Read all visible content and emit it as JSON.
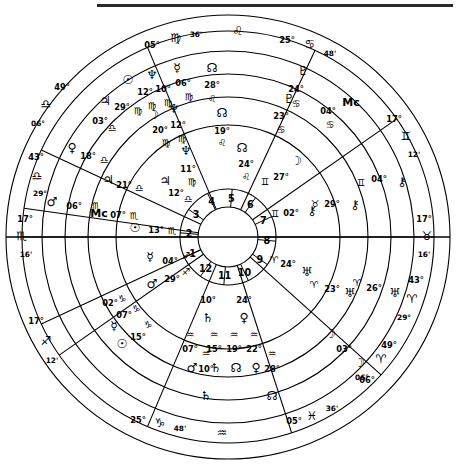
{
  "chart_data": {
    "type": "astrology-wheel",
    "center": {
      "cx": 228,
      "cy": 237
    },
    "rings": [
      112,
      140,
      163,
      186,
      206,
      222
    ],
    "hub_radius": 30,
    "house_numbers": [
      "1",
      "2",
      "3",
      "4",
      "5",
      "6",
      "7",
      "8",
      "9",
      "10",
      "11",
      "12"
    ],
    "glyphs": {
      "aries": "♈",
      "taurus": "♉",
      "gemini": "♊",
      "cancer": "♋",
      "leo": "♌",
      "virgo": "♍",
      "libra": "♎",
      "scorpio": "♏",
      "sagittarius": "♐",
      "capricorn": "♑",
      "aquarius": "♒",
      "pisces": "♓",
      "sun": "☉",
      "moon": "☽",
      "mercury": "☿",
      "venus": "♀",
      "mars": "♂",
      "jupiter": "♃",
      "saturn": "♄",
      "uranus": "♅",
      "neptune": "♆",
      "pluto": "♇",
      "node": "☊",
      "chiron": "⚷",
      "asc": "As",
      "mc": "Mc"
    },
    "house_cusps": [
      {
        "house": "1",
        "deg": "02°",
        "sign": "capricorn",
        "min": "48'",
        "outer_deg": "25°",
        "outer_sign": "capricorn",
        "outer_min": "48'",
        "angle": 205
      },
      {
        "house": "2",
        "deg": "05°",
        "sign": "pisces",
        "min": "36'",
        "outer_deg": "05°",
        "outer_sign": "pisces",
        "outer_min": "36'",
        "angle": 247
      },
      {
        "house": "3",
        "deg": "06°",
        "sign": "aries",
        "min": "49'",
        "outer_deg": "06°",
        "outer_sign": "aries",
        "outer_min": "49'",
        "angle": 288
      },
      {
        "house": "4",
        "deg": "29°",
        "sign": "aries",
        "min": "43'",
        "outer_deg": "29°",
        "outer_sign": "aries",
        "outer_min": "43'",
        "angle": 318
      },
      {
        "house": "5",
        "deg": "17°",
        "sign": "taurus",
        "min": "16'",
        "outer_deg": "17°",
        "outer_sign": "taurus",
        "outer_min": "16'",
        "angle": 0
      },
      {
        "house": "6",
        "deg": "12°",
        "sign": "gemini",
        "min": "12'",
        "outer_deg": "17°",
        "outer_sign": "gemini",
        "outer_min": "12'",
        "angle": 35
      },
      {
        "house": "7",
        "deg": "25°",
        "sign": "cancer",
        "min": "48'",
        "outer_deg": "25°",
        "outer_sign": "cancer",
        "outer_min": "48'",
        "angle": 65
      },
      {
        "house": "8",
        "deg": "05°",
        "sign": "virgo",
        "min": "36'",
        "outer_deg": "05°",
        "outer_sign": "virgo",
        "outer_min": "36'",
        "angle": 113
      },
      {
        "house": "9",
        "deg": "06°",
        "sign": "libra",
        "min": "49'",
        "outer_deg": "06°",
        "outer_sign": "libra",
        "outer_min": "49'",
        "angle": 155
      },
      {
        "house": "10",
        "deg": "29°",
        "sign": "libra",
        "min": "43'",
        "outer_deg": "29°",
        "outer_sign": "libra",
        "outer_min": "43'",
        "angle": 172
      },
      {
        "house": "11",
        "deg": "17°",
        "sign": "scorpio",
        "min": "16'",
        "outer_deg": "17°",
        "outer_sign": "scorpio",
        "outer_min": "16'",
        "angle": 180
      },
      {
        "house": "12",
        "deg": "17°",
        "sign": "sagittarius",
        "min": "12'",
        "outer_deg": "17°",
        "outer_sign": "sagittarius",
        "outer_min": "12'",
        "angle": 215
      }
    ],
    "outer_labels": [
      {
        "deg": "05°",
        "sign": "virgo",
        "min": "36'",
        "x": 152,
        "y": 48,
        "sx": 176,
        "sy": 42,
        "mx": 196,
        "my": 37
      },
      {
        "deg": "",
        "sign": "leo",
        "min": "",
        "x": 0,
        "y": 0,
        "sx": 238,
        "sy": 35,
        "mx": 0,
        "my": 0
      },
      {
        "deg": "25°",
        "sign": "cancer",
        "min": "48'",
        "x": 287,
        "y": 43,
        "sx": 310,
        "sy": 48,
        "mx": 330,
        "my": 56
      },
      {
        "deg": "17°",
        "sign": "gemini",
        "min": "12'",
        "x": 394,
        "y": 122,
        "sx": 406,
        "sy": 140,
        "mx": 414,
        "my": 157
      },
      {
        "deg": "17°",
        "sign": "taurus",
        "min": "16'",
        "x": 424,
        "y": 222,
        "sx": 427,
        "sy": 240,
        "mx": 424,
        "my": 257
      },
      {
        "deg": "43°",
        "sign": "aries",
        "min": "29°",
        "x": 416,
        "y": 283,
        "sx": 412,
        "sy": 303,
        "mx": 404,
        "my": 320
      },
      {
        "deg": "49°",
        "sign": "aries",
        "min": "06°",
        "x": 389,
        "y": 348,
        "sx": 381,
        "sy": 363,
        "mx": 362,
        "my": 380
      },
      {
        "deg": "05°",
        "sign": "pisces",
        "min": "36'",
        "x": 294,
        "y": 424,
        "sx": 312,
        "sy": 420,
        "mx": 332,
        "my": 411
      },
      {
        "deg": "",
        "sign": "aquarius",
        "min": "",
        "x": 0,
        "y": 0,
        "sx": 222,
        "sy": 437,
        "mx": 0,
        "my": 0
      },
      {
        "deg": "25°",
        "sign": "capricorn",
        "min": "48'",
        "x": 138,
        "y": 423,
        "sx": 160,
        "sy": 427,
        "mx": 180,
        "my": 431
      },
      {
        "deg": "17°",
        "sign": "sagittarius",
        "min": "12'",
        "x": 36,
        "y": 324,
        "sx": 46,
        "sy": 345,
        "mx": 52,
        "my": 363
      },
      {
        "deg": "17°",
        "sign": "scorpio",
        "min": "16'",
        "x": 25,
        "y": 222,
        "sx": 22,
        "sy": 240,
        "mx": 26,
        "my": 257
      },
      {
        "deg": "43°",
        "sign": "libra",
        "min": "29°",
        "x": 36,
        "y": 160,
        "sx": 37,
        "sy": 180,
        "mx": 40,
        "my": 196
      },
      {
        "deg": "49°",
        "sign": "libra",
        "min": "06°",
        "x": 62,
        "y": 90,
        "sx": 46,
        "sy": 108,
        "mx": 38,
        "my": 126
      }
    ],
    "planets_outer_ring": [
      {
        "name": "pluto",
        "deg": "24°",
        "sign": "cancer",
        "gx": 303,
        "gy": 75,
        "dx": 296,
        "dy": 92,
        "sx": 296,
        "sy": 107
      },
      {
        "name": "mc",
        "deg": "04°",
        "sign": "cancer",
        "gx": 351,
        "gy": 106,
        "dx": 328,
        "dy": 114,
        "sx": 330,
        "sy": 128,
        "islabel": true
      },
      {
        "name": "chiron",
        "deg": "04°",
        "sign": "gemini",
        "gx": 402,
        "gy": 186,
        "dx": 379,
        "dy": 182,
        "sx": 361,
        "sy": 186
      },
      {
        "name": "uranus",
        "deg": "26°",
        "sign": "aries",
        "gx": 395,
        "gy": 297,
        "dx": 374,
        "dy": 291,
        "sx": 357,
        "sy": 286
      },
      {
        "name": "moon",
        "deg": "06°",
        "sign": "aries",
        "gx": 359,
        "gy": 367,
        "dx": 367,
        "dy": 383,
        "sx": 0,
        "sy": 0
      },
      {
        "name": "node",
        "deg": "28°",
        "sign": "aquarius",
        "gx": 272,
        "gy": 400,
        "dx": 272,
        "dy": 372,
        "sx": 272,
        "sy": 357
      },
      {
        "name": "saturn",
        "deg": "10°",
        "sign": "aquarius",
        "gx": 206,
        "gy": 400,
        "dx": 206,
        "dy": 372,
        "sx": 206,
        "sy": 357
      },
      {
        "name": "mars",
        "deg": "06°",
        "sign": "scorpio",
        "gx": 52,
        "gy": 206,
        "dx": 74,
        "dy": 209,
        "sx": 96,
        "sy": 209
      },
      {
        "name": "venus",
        "deg": "18°",
        "sign": "libra",
        "gx": 72,
        "gy": 152,
        "dx": 88,
        "dy": 159,
        "sx": 104,
        "sy": 163
      },
      {
        "name": "jupiter",
        "deg": "29°",
        "sign": "virgo",
        "gx": 105,
        "gy": 105,
        "dx": 122,
        "dy": 110,
        "sx": 138,
        "sy": 114
      },
      {
        "name": "sun",
        "deg": "12°",
        "sign": "virgo",
        "gx": 128,
        "gy": 84,
        "dx": 145,
        "dy": 95,
        "sx": 152,
        "sy": 109
      },
      {
        "name": "neptune",
        "deg": "10°",
        "sign": "virgo",
        "gx": 152,
        "gy": 79,
        "dx": 163,
        "dy": 92,
        "sx": 168,
        "sy": 106
      },
      {
        "name": "mercury",
        "deg": "06°",
        "sign": "virgo",
        "gx": 177,
        "gy": 72,
        "dx": 183,
        "dy": 86,
        "sx": 189,
        "sy": 100
      }
    ],
    "planets_mid_ring": [
      {
        "name": "node",
        "deg": "28°",
        "sign": "leo",
        "gx": 212,
        "gy": 72,
        "dx": 212,
        "dy": 88,
        "sx": 212,
        "sy": 102
      },
      {
        "name": "pluto",
        "deg": "23°",
        "sign": "cancer",
        "gx": 289,
        "gy": 103,
        "dx": 281,
        "dy": 119,
        "sx": 281,
        "sy": 133
      },
      {
        "name": "moon",
        "deg": "27°",
        "sign": "gemini",
        "gx": 296,
        "gy": 165,
        "dx": 281,
        "dy": 180,
        "sx": 265,
        "sy": 185
      },
      {
        "name": "chiron",
        "deg": "29°",
        "sign": "taurus",
        "gx": 355,
        "gy": 209,
        "dx": 332,
        "dy": 207,
        "sx": 315,
        "sy": 207
      },
      {
        "name": "uranus",
        "deg": "23°",
        "sign": "aries",
        "gx": 350,
        "gy": 297,
        "dx": 332,
        "dy": 292,
        "sx": 314,
        "sy": 288
      },
      {
        "name": "moon2",
        "deg": "03°",
        "sign": "aries",
        "gx": 330,
        "gy": 338,
        "dx": 344,
        "dy": 352,
        "sx": 0,
        "sy": 0
      },
      {
        "name": "venus",
        "deg": "22°",
        "sign": "aquarius",
        "gx": 256,
        "gy": 372,
        "dx": 254,
        "dy": 352,
        "sx": 254,
        "sy": 338
      },
      {
        "name": "node2",
        "deg": "19°",
        "sign": "aquarius",
        "gx": 236,
        "gy": 372,
        "dx": 234,
        "dy": 352,
        "sx": 234,
        "sy": 338
      },
      {
        "name": "saturn2",
        "deg": "15°",
        "sign": "aquarius",
        "gx": 216,
        "gy": 372,
        "dx": 214,
        "dy": 352,
        "sx": 214,
        "sy": 338
      },
      {
        "name": "mars2",
        "deg": "07°",
        "sign": "aquarius",
        "gx": 192,
        "gy": 372,
        "dx": 190,
        "dy": 352,
        "sx": 190,
        "sy": 338
      },
      {
        "name": "sun2",
        "deg": "15°",
        "sign": "capricorn",
        "gx": 122,
        "gy": 348,
        "dx": 138,
        "dy": 340,
        "sx": 148,
        "sy": 328
      },
      {
        "name": "mercury2",
        "deg": "07°",
        "sign": "capricorn",
        "gx": 114,
        "gy": 330,
        "dx": 124,
        "dy": 318,
        "sx": 136,
        "sy": 312
      },
      {
        "name": "as",
        "deg": "02°",
        "sign": "capricorn",
        "gx": 95,
        "gy": 322,
        "dx": 110,
        "dy": 306,
        "sx": 122,
        "sy": 302,
        "islabel": true
      },
      {
        "name": "mc2",
        "deg": "07°",
        "sign": "scorpio",
        "gx": 99,
        "gy": 217,
        "dx": 118,
        "dy": 218,
        "sx": 134,
        "sy": 219,
        "islabel": true
      },
      {
        "name": "jupiter2",
        "deg": "21°",
        "sign": "libra",
        "gx": 108,
        "gy": 184,
        "dx": 124,
        "dy": 188,
        "sx": 139,
        "sy": 191
      },
      {
        "name": "as2",
        "deg": "03°",
        "sign": "libra",
        "gx": 88,
        "gy": 114,
        "dx": 100,
        "dy": 124,
        "sx": 112,
        "sy": 131,
        "islabel": true
      },
      {
        "name": "moon3",
        "deg": "20°",
        "sign": "virgo",
        "gx": 153,
        "gy": 119,
        "dx": 160,
        "dy": 133,
        "sx": 166,
        "sy": 146
      },
      {
        "name": "neptune2",
        "deg": "12°",
        "sign": "virgo",
        "gx": 174,
        "gy": 113,
        "dx": 178,
        "dy": 128,
        "sx": 182,
        "sy": 142
      }
    ],
    "planets_inner_ring": [
      {
        "name": "node",
        "deg": "19°",
        "sign": "leo",
        "gx": 222,
        "gy": 117,
        "dx": 222,
        "dy": 134,
        "sx": 222,
        "sy": 146
      },
      {
        "name": "neptune",
        "deg": "11°",
        "sign": "virgo",
        "gx": 186,
        "gy": 155,
        "dx": 188,
        "dy": 172,
        "sx": 192,
        "sy": 185
      },
      {
        "name": "node3",
        "deg": "24°",
        "sign": "leo",
        "gx": 242,
        "gy": 152,
        "dx": 246,
        "dy": 167,
        "sx": 246,
        "sy": 180
      },
      {
        "name": "chiron3",
        "deg": "02°",
        "sign": "gemini",
        "gx": 312,
        "gy": 215,
        "dx": 291,
        "dy": 216,
        "sx": 275,
        "sy": 217
      },
      {
        "name": "uranus3",
        "deg": "24°",
        "sign": "aries",
        "gx": 307,
        "gy": 276,
        "dx": 288,
        "dy": 267,
        "sx": 274,
        "sy": 263
      },
      {
        "name": "mercury3",
        "deg": "04°",
        "sign": "sagittarius",
        "gx": 150,
        "gy": 261,
        "dx": 170,
        "dy": 264,
        "sx": 186,
        "sy": 259
      },
      {
        "name": "mars3",
        "deg": "29°",
        "sign": "sagittarius",
        "gx": 152,
        "gy": 288,
        "dx": 172,
        "dy": 282,
        "sx": 186,
        "sy": 275
      },
      {
        "name": "sun3",
        "deg": "13°",
        "sign": "scorpio",
        "gx": 135,
        "gy": 232,
        "dx": 156,
        "dy": 233,
        "sx": 172,
        "sy": 234
      },
      {
        "name": "jupiter3",
        "deg": "12°",
        "sign": "libra",
        "gx": 165,
        "gy": 185,
        "dx": 176,
        "dy": 196,
        "sx": 188,
        "sy": 202
      },
      {
        "name": "venus3",
        "deg": "24°",
        "sign": "aquarius",
        "gx": 244,
        "gy": 322,
        "dx": 244,
        "dy": 303,
        "sx": 0,
        "sy": 0
      },
      {
        "name": "saturn3",
        "deg": "10°",
        "sign": "aquarius",
        "gx": 208,
        "gy": 322,
        "dx": 208,
        "dy": 303,
        "sx": 0,
        "sy": 0
      }
    ]
  }
}
